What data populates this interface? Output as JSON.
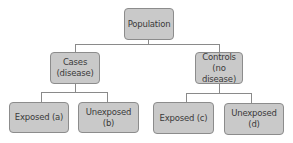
{
  "diagram": {
    "type": "tree",
    "root": {
      "label": "Population"
    },
    "level1": [
      {
        "line1": "Cases",
        "line2": "(disease)"
      },
      {
        "line1": "Controls",
        "line2": "(no disease)"
      }
    ],
    "level2": [
      {
        "label": "Exposed (a)"
      },
      {
        "label": "Unexposed (b)"
      },
      {
        "label": "Exposed (c)"
      },
      {
        "label": "Unexposed (d)"
      }
    ],
    "colors": {
      "box_fill": "#c9c9c9",
      "box_border": "#8c8c8c",
      "text": "#3a3a3a",
      "connector": "#8a8a8a"
    }
  }
}
